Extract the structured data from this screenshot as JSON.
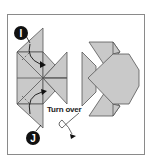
{
  "diagram": {
    "steps": [
      {
        "id": "step-i",
        "label": "I"
      },
      {
        "id": "step-j",
        "label": "J"
      }
    ],
    "instruction": "Turn over",
    "colors": {
      "paper": "#c9c9c9",
      "line": "#555555",
      "badge": "#111111",
      "frame": "#8a8a8a"
    }
  }
}
